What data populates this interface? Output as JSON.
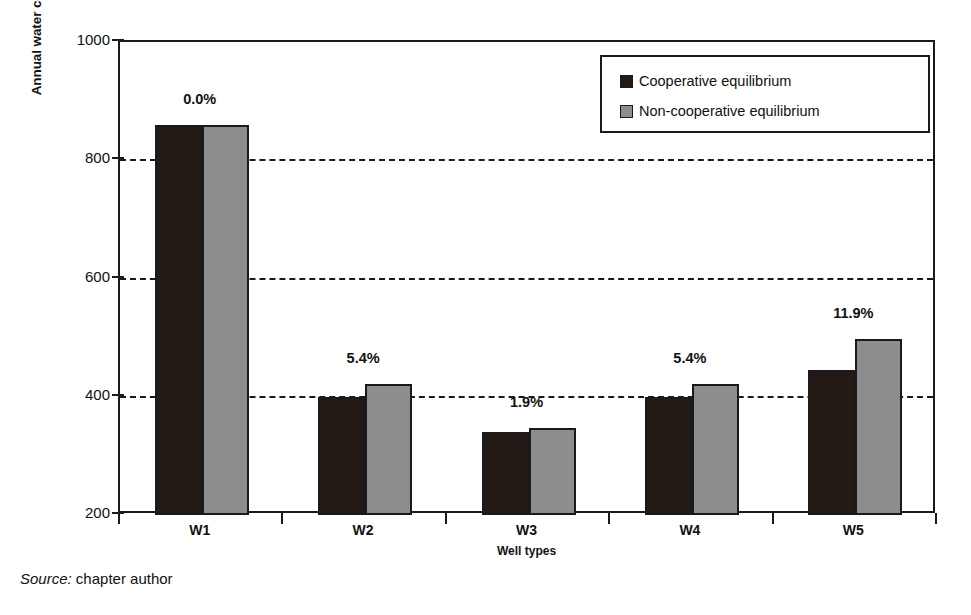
{
  "chart_data": {
    "type": "bar",
    "title": "",
    "xlabel": "Well types",
    "ylabel": "Annual water consumption (1.000 m³)",
    "categories": [
      "W1",
      "W2",
      "W3",
      "W4",
      "W5"
    ],
    "ylim": [
      200,
      1000
    ],
    "yticks": [
      200,
      400,
      600,
      800,
      1000
    ],
    "ytick_labels": [
      "200",
      "400",
      "600",
      "800",
      "1000"
    ],
    "gridlines": [
      400,
      600,
      800
    ],
    "grid": true,
    "legend_position": "top-right",
    "series": [
      {
        "name": "Cooperative equilibrium",
        "color": "#231a16",
        "values": [
          860,
          400,
          340,
          400,
          445
        ]
      },
      {
        "name": "Non-cooperative equilibrium",
        "color": "#8d8d8d",
        "values": [
          860,
          422,
          347,
          422,
          498
        ]
      }
    ],
    "annotations": [
      {
        "category": "W1",
        "text": "0.0%"
      },
      {
        "category": "W2",
        "text": "5.4%"
      },
      {
        "category": "W3",
        "text": "1.9%"
      },
      {
        "category": "W4",
        "text": "5.4%"
      },
      {
        "category": "W5",
        "text": "11.9%"
      }
    ]
  },
  "caption": {
    "prefix": "Source:",
    "text": " chapter author"
  }
}
